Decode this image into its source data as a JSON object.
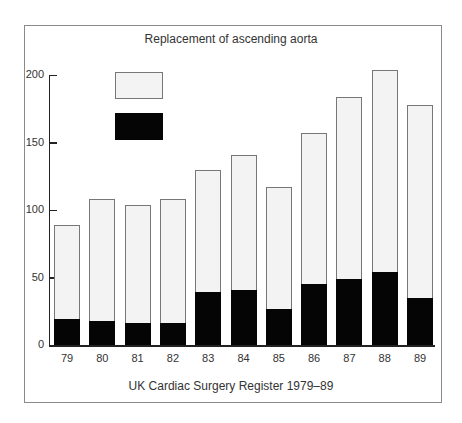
{
  "chart_data": {
    "type": "bar",
    "stacked": true,
    "title": "Replacement of ascending aorta",
    "caption": "UK Cardiac Surgery Register 1979–89",
    "xlabel": "",
    "ylabel": "",
    "ylim": [
      0,
      200
    ],
    "yticks": [
      0,
      50,
      100,
      150,
      200
    ],
    "categories": [
      "79",
      "80",
      "81",
      "82",
      "83",
      "84",
      "85",
      "86",
      "87",
      "88",
      "89"
    ],
    "totals": [
      89,
      108,
      104,
      108,
      130,
      141,
      117,
      157,
      184,
      204,
      178
    ],
    "series": [
      {
        "name": "dark (lower segment)",
        "color": "#050505",
        "values": [
          19,
          18,
          16,
          16,
          39,
          41,
          27,
          45,
          49,
          54,
          35
        ]
      },
      {
        "name": "light (upper segment)",
        "color": "#f3f3f3",
        "values": [
          70,
          90,
          88,
          92,
          91,
          100,
          90,
          112,
          135,
          150,
          143
        ]
      }
    ],
    "legend": {
      "position": "upper-left",
      "entries": [
        {
          "color": "#f3f3f3",
          "label": ""
        },
        {
          "color": "#050505",
          "label": ""
        }
      ]
    },
    "grid": false
  }
}
